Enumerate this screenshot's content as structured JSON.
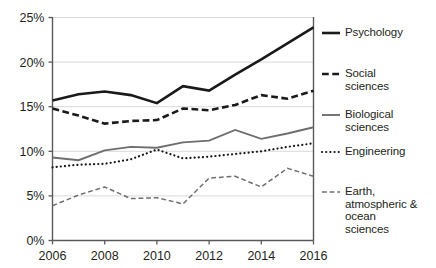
{
  "chart_data": {
    "type": "line",
    "title": "",
    "subtitle": "",
    "xlabel": "",
    "ylabel": "",
    "x": [
      2006,
      2007,
      2008,
      2009,
      2010,
      2011,
      2012,
      2013,
      2014,
      2015,
      2016
    ],
    "xtick_labels": [
      "2006",
      "2008",
      "2010",
      "2012",
      "2014",
      "2016"
    ],
    "xtick_values": [
      2006,
      2008,
      2010,
      2012,
      2014,
      2016
    ],
    "ytick_labels": [
      "0%",
      "5%",
      "10%",
      "15%",
      "20%",
      "25%"
    ],
    "ytick_values": [
      0,
      5,
      10,
      15,
      20,
      25
    ],
    "xlim": [
      2006,
      2016
    ],
    "ylim": [
      0,
      25
    ],
    "grid": "horizontal",
    "legend_position": "right",
    "value_unit": "percent",
    "series": [
      {
        "name": "Psychology",
        "legend_label": "Psychology",
        "style": "solid",
        "color": "#1a1a1a",
        "width": 2.6,
        "values": [
          15.7,
          16.4,
          16.7,
          16.3,
          15.4,
          17.3,
          16.8,
          18.6,
          20.3,
          22.1,
          23.9
        ]
      },
      {
        "name": "Social sciences",
        "legend_label": "Social\nsciences",
        "style": "dashed",
        "color": "#1a1a1a",
        "width": 2.6,
        "values": [
          14.8,
          14.0,
          13.1,
          13.4,
          13.5,
          14.8,
          14.6,
          15.2,
          16.3,
          15.9,
          16.8
        ]
      },
      {
        "name": "Biological sciences",
        "legend_label": "Biological\nsciences",
        "style": "solid",
        "color": "#6d6e70",
        "width": 1.9,
        "values": [
          9.3,
          9.0,
          10.1,
          10.5,
          10.4,
          11.0,
          11.2,
          12.4,
          11.4,
          12.0,
          12.7
        ]
      },
      {
        "name": "Engineering",
        "legend_label": "Engineering",
        "style": "dotted",
        "color": "#1a1a1a",
        "width": 2.2,
        "values": [
          8.2,
          8.5,
          8.6,
          9.1,
          10.2,
          9.2,
          9.4,
          9.7,
          10.0,
          10.5,
          10.9
        ]
      },
      {
        "name": "Earth, atmospheric & ocean sciences",
        "legend_label": "Earth,\natmospheric &\nocean\nsciences",
        "style": "dashed",
        "color": "#6d6e70",
        "width": 1.5,
        "values": [
          3.9,
          5.1,
          6.0,
          4.7,
          4.8,
          4.1,
          7.0,
          7.2,
          6.0,
          8.1,
          7.2
        ]
      }
    ]
  },
  "axes": {
    "y_labels": [
      "25%",
      "20%",
      "15%",
      "10%",
      "5%",
      "0%"
    ],
    "x_labels": [
      "2006",
      "2008",
      "2010",
      "2012",
      "2014",
      "2016"
    ]
  },
  "legend": {
    "items": [
      {
        "label": "Psychology"
      },
      {
        "label": "Social\nsciences"
      },
      {
        "label": "Biological\nsciences"
      },
      {
        "label": "Engineering"
      },
      {
        "label": "Earth,\natmospheric &\nocean\nsciences"
      }
    ]
  },
  "colors": {
    "axis": "#58595b",
    "grid": "#d9d9d9",
    "dark_series": "#1a1a1a",
    "gray_series": "#6d6e70",
    "text": "#231f20",
    "background": "#ffffff"
  }
}
